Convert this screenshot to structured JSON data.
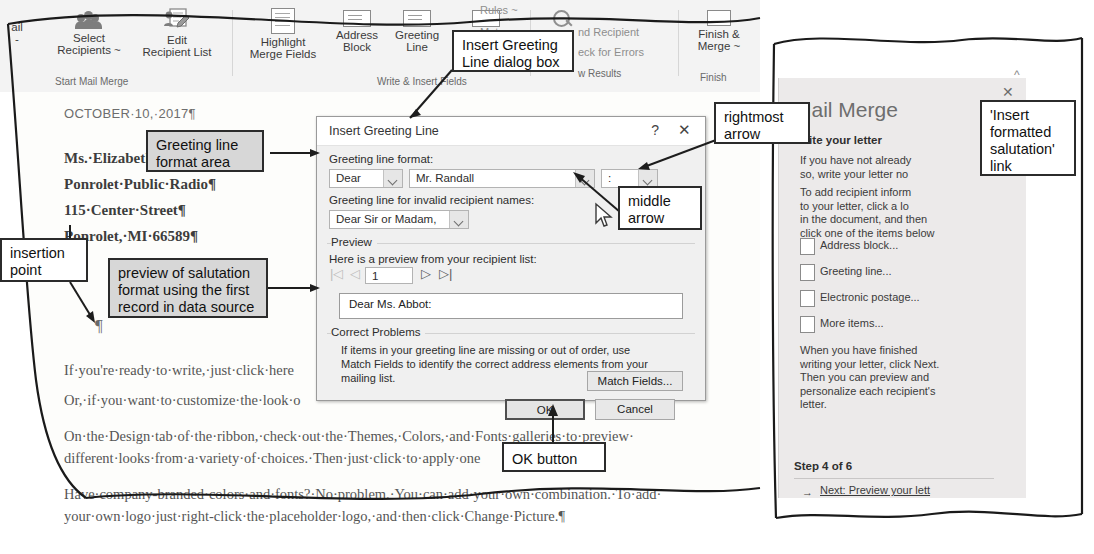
{
  "ribbon": {
    "buttons": [
      {
        "name": "mail",
        "l1": "ail",
        "l2": "-"
      },
      {
        "name": "select-recipients",
        "l1": "Select",
        "l2": "Recipients ~"
      },
      {
        "name": "edit-recipient-list",
        "l1": "Edit",
        "l2": "Recipient List"
      },
      {
        "name": "highlight-merge-fields",
        "l1": "Highlight",
        "l2": "Merge Fields"
      },
      {
        "name": "address-block",
        "l1": "Address",
        "l2": "Block"
      },
      {
        "name": "greeting-line",
        "l1": "Greeting",
        "l2": "Line"
      },
      {
        "name": "insert-merge-field",
        "l1": "Insert Merge",
        "l2": "Field ~"
      },
      {
        "name": "finish-and-merge",
        "l1": "Finish &",
        "l2": "Merge ~"
      }
    ],
    "small_commands": [
      "Rules ~",
      "Mat",
      "Upd",
      "nd Recipient",
      "eck for Errors",
      "w Results"
    ],
    "group_titles": [
      "Start Mail Merge",
      "Write & Insert Fields",
      "Preview Results",
      "Finish"
    ],
    "collapse_icon": "chevron-up-icon"
  },
  "document": {
    "date": "OCTOBER·10,·2017¶",
    "address": [
      "Ms.·Elizabeth·Abbot¶",
      "Ponrolet·Public·Radio¶",
      "115·Center·Street¶",
      "Ponrolet,·MI·66589¶"
    ],
    "body": [
      "If·you're·ready·to·write,·just·click·here",
      "Or,·if·you·want·to·customize·the·look·o",
      "On·the·Design·tab·of·the·ribbon,·check·out·the·Themes,·Colors,·and·Fonts·galleries·to·preview·",
      "different·looks·from·a·variety·of·choices.·Then·just·click·to·apply·one",
      "Have·company-branded·colors·and·fonts?·No·problem.·You·can·add·your·own·combination.·To·add·",
      "your·own·logo·just·right-click·the·placeholder·logo,·and·then·click·Change·Picture.¶"
    ]
  },
  "dialog": {
    "title": "Insert Greeting Line",
    "help_icon": "?",
    "close_icon": "✕",
    "greeting_format_label": "Greeting line format:",
    "salutation_value": "Dear",
    "name_format_value": "Mr. Randall",
    "punctuation_value": ":",
    "invalid_label": "Greeting line for invalid recipient names:",
    "invalid_value": "Dear Sir or Madam,",
    "preview_group": "Preview",
    "preview_label": "Here is a preview from your recipient list:",
    "record_number": "1",
    "nav_first": "|◁",
    "nav_prev": "◁",
    "nav_next": "▷",
    "nav_last": "▷|",
    "preview_text": "Dear Ms. Abbot:",
    "correct_group": "Correct Problems",
    "correct_text": "If items in your greeting line are missing or out of order, use Match Fields to identify the correct address elements from your mailing list.",
    "match_fields_button": "Match Fields...",
    "ok_button": "OK",
    "cancel_button": "Cancel"
  },
  "task_pane": {
    "close_icon": "✕",
    "title": "Mail Merge",
    "section": "Write your letter",
    "paragraph1": "If you have not already\nso, write your letter no",
    "paragraph2": "To add recipient inform\nto your letter, click a lo\nin the document, and then\nclick one of the items below",
    "items": [
      {
        "label": "Address block...",
        "icon": "address-block-icon"
      },
      {
        "label": "Greeting line...",
        "icon": "greeting-line-icon"
      },
      {
        "label": "Electronic postage...",
        "icon": "electronic-postage-icon"
      },
      {
        "label": "More items...",
        "icon": "more-items-icon"
      }
    ],
    "paragraph3": "When you have finished\nwriting your letter, click Next.\nThen you can preview and\npersonalize each recipient's\nletter.",
    "step": "Step 4 of 6",
    "next_link": "Next: Preview your lett",
    "next_arrow_icon": "arrow-right-icon"
  },
  "callouts": [
    {
      "id": "insert-greeting-line-dialog-box",
      "text": "Insert Greeting\nLine dialog box",
      "style": "white"
    },
    {
      "id": "greeting-line-format-area",
      "text": "Greeting line\nformat area",
      "style": "grey"
    },
    {
      "id": "rightmost-arrow",
      "text": "rightmost\narrow",
      "style": "white"
    },
    {
      "id": "middle-arrow",
      "text": "middle\narrow",
      "style": "white"
    },
    {
      "id": "insertion-point",
      "text": "insertion\npoint",
      "style": "white"
    },
    {
      "id": "preview-of-salutation",
      "text": "preview of salutation\nformat using the first\nrecord in data source",
      "style": "grey"
    },
    {
      "id": "ok-button",
      "text": "OK button",
      "style": "white"
    },
    {
      "id": "insert-formatted-salutation-link",
      "text": "'Insert\nformatted\nsalutation'\nlink",
      "style": "white"
    }
  ],
  "colors": {
    "dialog_bg": "#f0f0f0",
    "pane_bg": "#eceaea",
    "ribbon_bg": "#f3f3f3",
    "callout_grey": "#d7d7d7"
  }
}
